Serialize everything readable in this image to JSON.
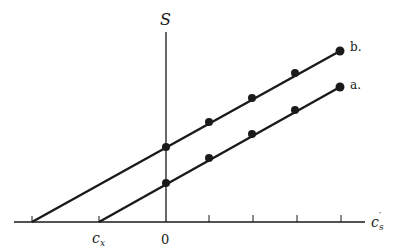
{
  "diagram": {
    "y_axis_label": "S",
    "x_axis_label": "c",
    "x_axis_label_sub": "s",
    "x_axis_label_prime": "′",
    "origin_label": "0",
    "intercept_label": "c",
    "intercept_label_sub": "x",
    "colors": {
      "ink": "#1a1a1a",
      "background": "#ffffff"
    },
    "lines": [
      {
        "label": "b.",
        "start": [
          32,
          222
        ],
        "points": [
          [
            166,
            147
          ],
          [
            209,
            122
          ],
          [
            252,
            98
          ],
          [
            295,
            73
          ],
          [
            340,
            51
          ]
        ]
      },
      {
        "label": "a.",
        "start": [
          99,
          222
        ],
        "points": [
          [
            166,
            183
          ],
          [
            209,
            158
          ],
          [
            252,
            134
          ],
          [
            295,
            110
          ],
          [
            340,
            87
          ]
        ]
      }
    ],
    "ticks_x": [
      32,
      99,
      166,
      209,
      253,
      297,
      341
    ]
  }
}
